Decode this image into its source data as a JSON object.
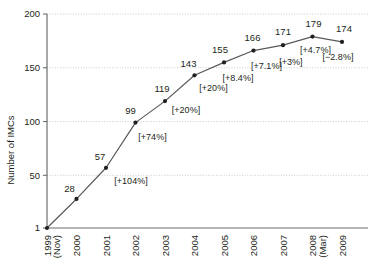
{
  "chart_data": {
    "type": "line",
    "title": "",
    "xlabel": "",
    "ylabel": "Number of IMCs",
    "x": [
      "1999 (Nov)",
      "2000",
      "2001",
      "2002",
      "2003",
      "2004",
      "2005",
      "2006",
      "2007",
      "2008 (Mar)",
      "2009"
    ],
    "categories": [
      "1999 (Nov)",
      "2000",
      "2001",
      "2002",
      "2003",
      "2004",
      "2005",
      "2006",
      "2007",
      "2008 (Mar)",
      "2009"
    ],
    "values": [
      1,
      28,
      57,
      99,
      119,
      143,
      155,
      166,
      171,
      179,
      174
    ],
    "growth_labels": [
      "",
      "",
      "[+104%]",
      "[+74%]",
      "[+20%]",
      "[+20%]",
      "[+8.4%]",
      "[+7.1%]",
      "[+3%]",
      "[+4.7%]",
      "[−2.8%]"
    ],
    "ylim": [
      1,
      200
    ],
    "yticks": [
      1,
      50,
      100,
      150,
      200
    ],
    "ytick_labels": [
      "1",
      "50",
      "100",
      "150",
      "200"
    ],
    "grid": true,
    "legend": "none",
    "line_color": "#58595b",
    "marker_color": "#231f20",
    "grid_color": "#bcbcbc",
    "axis_color": "#6d6e71",
    "text_color": "#231f20"
  },
  "axes": {
    "y_title": "Number of IMCs",
    "x_tick_lines": [
      [
        "1999",
        "(Nov)"
      ],
      [
        "2000",
        ""
      ],
      [
        "2001",
        ""
      ],
      [
        "2002",
        ""
      ],
      [
        "2003",
        ""
      ],
      [
        "2004",
        ""
      ],
      [
        "2005",
        ""
      ],
      [
        "2006",
        ""
      ],
      [
        "2007",
        ""
      ],
      [
        "2008",
        "(Mar)"
      ],
      [
        "2009",
        ""
      ]
    ]
  },
  "points": [
    {
      "label": "1999 (Nov)",
      "value": 1,
      "value_text": "",
      "growth_text": ""
    },
    {
      "label": "2000",
      "value": 28,
      "value_text": "28",
      "growth_text": ""
    },
    {
      "label": "2001",
      "value": 57,
      "value_text": "57",
      "growth_text": "[+104%]"
    },
    {
      "label": "2002",
      "value": 99,
      "value_text": "99",
      "growth_text": "[+74%]"
    },
    {
      "label": "2003",
      "value": 119,
      "value_text": "119",
      "growth_text": "[+20%]"
    },
    {
      "label": "2004",
      "value": 143,
      "value_text": "143",
      "growth_text": "[+20%]"
    },
    {
      "label": "2005",
      "value": 155,
      "value_text": "155",
      "growth_text": "[+8.4%]"
    },
    {
      "label": "2006",
      "value": 166,
      "value_text": "166",
      "growth_text": "[+7.1%]"
    },
    {
      "label": "2007",
      "value": 171,
      "value_text": "171",
      "growth_text": "[+3%]"
    },
    {
      "label": "2008 (Mar)",
      "value": 179,
      "value_text": "179",
      "growth_text": "[+4.7%]"
    },
    {
      "label": "2009",
      "value": 174,
      "value_text": "174",
      "growth_text": "[−2.8%]"
    }
  ]
}
